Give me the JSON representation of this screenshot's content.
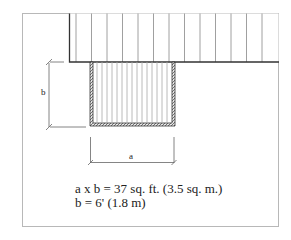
{
  "diagram": {
    "dimension_labels": {
      "a": "a",
      "b": "b"
    },
    "caption": {
      "line1": "a x b = 37 sq. ft. (3.5 sq. m.)",
      "line2": "b = 6' (1.8 m)"
    },
    "colors": {
      "frame": "#b0b0b0",
      "outline": "#333333",
      "slat": "#9a9a9a",
      "hatch": "#555555"
    }
  }
}
